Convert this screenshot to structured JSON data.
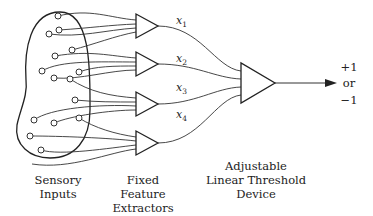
{
  "diagram": {
    "type": "perceptron",
    "stages": [
      {
        "id": "sensory",
        "caption": [
          "Sensory",
          "Inputs"
        ]
      },
      {
        "id": "features",
        "caption": [
          "Fixed",
          "Feature",
          "Extractors"
        ]
      },
      {
        "id": "threshold",
        "caption": [
          "Adjustable",
          "Linear Threshold",
          "Device"
        ]
      }
    ],
    "feature_outputs": [
      {
        "var": "x",
        "sub": "1"
      },
      {
        "var": "x",
        "sub": "2"
      },
      {
        "var": "x",
        "sub": "3"
      },
      {
        "var": "x",
        "sub": "4"
      }
    ],
    "output": {
      "top": "+1",
      "mid": "or",
      "bottom": "−1"
    }
  }
}
